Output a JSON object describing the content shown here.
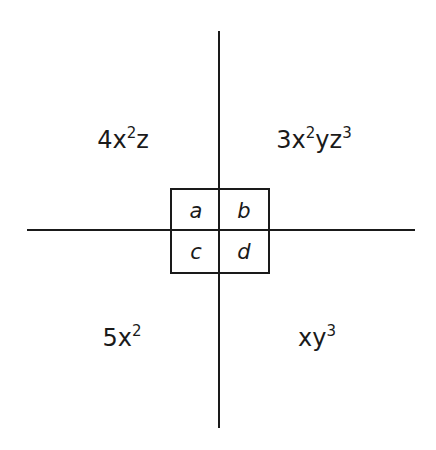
{
  "diagram": {
    "type": "quadrant-monomial-diagram",
    "quadrants": {
      "top_left": {
        "label": "4x²z",
        "parts": [
          {
            "text": "4x",
            "sup": "2"
          },
          {
            "text": "z",
            "sup": ""
          }
        ]
      },
      "top_right": {
        "label": "3x²yz³",
        "parts": [
          {
            "text": "3x",
            "sup": "2"
          },
          {
            "text": "yz",
            "sup": "3"
          }
        ]
      },
      "bottom_left": {
        "label": "5x²",
        "parts": [
          {
            "text": "5x",
            "sup": "2"
          }
        ]
      },
      "bottom_right": {
        "label": "xy³",
        "parts": [
          {
            "text": "xy",
            "sup": "3"
          }
        ]
      }
    },
    "center_cells": {
      "a": "a",
      "b": "b",
      "c": "c",
      "d": "d"
    },
    "colors": {
      "line": "#1a1a1a",
      "background": "#ffffff",
      "text": "#1a1a1a"
    }
  }
}
